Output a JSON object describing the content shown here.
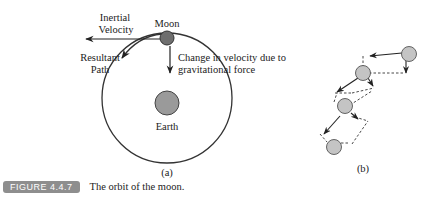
{
  "figure": {
    "number_label": "FIGURE 4.4.7",
    "caption": "The orbit of the moon.",
    "label_color": "#8e8e8e"
  },
  "panel_a": {
    "label": "(a)",
    "moon_label": "Moon",
    "earth_label": "Earth",
    "inertial_velocity_line1": "Inertial",
    "inertial_velocity_line2": "Velocity",
    "resultant_path_line1": "Resultant",
    "resultant_path_line2": "Path",
    "change_velocity_line1": "Change in velocity due to",
    "change_velocity_line2": "gravitational force",
    "moon_color": "#6e6e6e",
    "earth_color": "#9a9a9a"
  },
  "panel_b": {
    "label": "(b)",
    "body_color": "#c4c4c4"
  }
}
